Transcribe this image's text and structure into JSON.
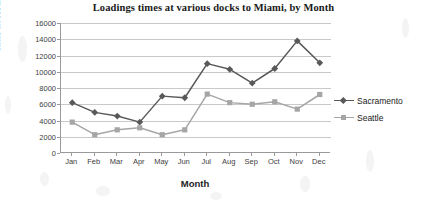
{
  "chart_data": {
    "type": "line",
    "title": "Loadings times at various docks to Miami, by Month",
    "xlabel": "Month",
    "ylabel": "Time in Hours",
    "categories": [
      "Jan",
      "Feb",
      "Mar",
      "Apr",
      "May",
      "Jun",
      "Jul",
      "Aug",
      "Sep",
      "Oct",
      "Nov",
      "Dec"
    ],
    "ylim": [
      0,
      16000
    ],
    "yticks": [
      0,
      2000,
      4000,
      6000,
      8000,
      10000,
      12000,
      14000,
      16000
    ],
    "ytick_labels": [
      "0",
      "2000",
      "4000",
      "6000",
      "8000",
      "10000",
      "12000",
      "14000",
      "16000"
    ],
    "grid": true,
    "legend_position": "right",
    "series": [
      {
        "name": "Sacramento",
        "color": "#595959",
        "marker": "diamond",
        "values": [
          6200,
          5000,
          4550,
          3800,
          7000,
          6800,
          11000,
          10300,
          8600,
          10400,
          13800,
          11100
        ]
      },
      {
        "name": "Seattle",
        "color": "#a6a6a6",
        "marker": "square",
        "values": [
          3800,
          2250,
          2850,
          3100,
          2250,
          2850,
          7250,
          6200,
          6000,
          6300,
          5400,
          7200
        ]
      }
    ]
  },
  "legend": {
    "items": [
      {
        "label": "Sacramento"
      },
      {
        "label": "Seattle"
      }
    ]
  }
}
